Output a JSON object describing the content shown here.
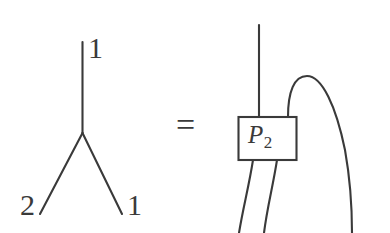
{
  "figure": {
    "type": "mathematical-string-diagram",
    "background_color": "#ffffff",
    "stroke_color": "#3a3a3a",
    "relation_symbol": "=",
    "left_side": {
      "name": "trivalent-tree",
      "description": "Y-shaped trivalent vertex with one upward stem and two downward legs",
      "labels": {
        "top_leg": "1",
        "bottom_left_leg": "2",
        "bottom_right_leg": "1"
      }
    },
    "right_side": {
      "name": "projector-box-diagram",
      "box_label_base": "P",
      "box_label_subscript": "2",
      "strand_count_into_box_top": 2,
      "strand_count_out_of_box_bottom": 2,
      "arc_strand": "right-curved-strand"
    }
  }
}
